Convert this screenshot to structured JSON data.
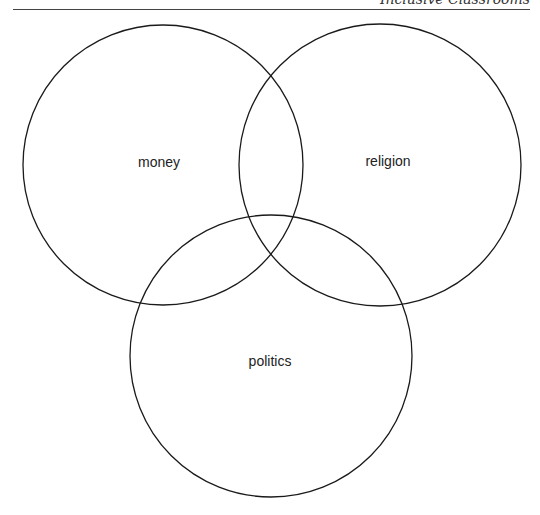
{
  "header": {
    "running_head": "Inclusive Classrooms"
  },
  "venn": {
    "stroke_color": "#1a1a1a",
    "circles": [
      {
        "label": "money",
        "cx": 163,
        "cy": 165,
        "r": 140,
        "label_x": 159,
        "label_y": 162
      },
      {
        "label": "religion",
        "cx": 380,
        "cy": 165,
        "r": 141,
        "label_x": 388,
        "label_y": 161
      },
      {
        "label": "politics",
        "cx": 271,
        "cy": 356,
        "r": 141,
        "label_x": 270,
        "label_y": 361
      }
    ]
  }
}
